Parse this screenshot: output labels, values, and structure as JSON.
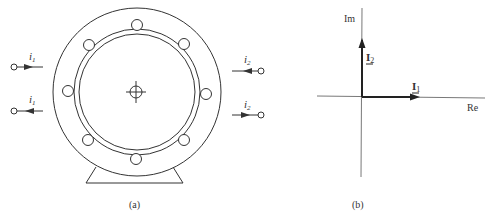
{
  "figure_a": {
    "caption": "(a)",
    "terminals": [
      {
        "label": "i",
        "sub": "1",
        "side": "left",
        "direction": "in"
      },
      {
        "label": "i",
        "sub": "1",
        "side": "left",
        "direction": "out"
      },
      {
        "label": "i",
        "sub": "2",
        "side": "right",
        "direction": "out"
      },
      {
        "label": "i",
        "sub": "2",
        "side": "right",
        "direction": "in"
      }
    ],
    "bolt_hole_count": 8
  },
  "figure_b": {
    "caption": "(b)",
    "axis_im": "Im",
    "axis_re": "Re",
    "phasor_1": {
      "label": "I",
      "sub": "1",
      "direction": "Re"
    },
    "phasor_2": {
      "label": "I",
      "sub": "2",
      "direction": "Im"
    }
  },
  "colors": {
    "stroke": "#333333",
    "background": "#ffffff"
  }
}
